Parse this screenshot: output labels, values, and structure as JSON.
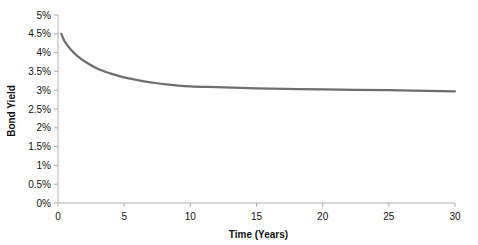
{
  "chart_data": {
    "type": "line",
    "title": "",
    "xlabel": "Time (Years)",
    "ylabel": "Bond Yield",
    "xlim": [
      0,
      30
    ],
    "ylim": [
      0,
      5
    ],
    "x_ticks": [
      0,
      5,
      10,
      15,
      20,
      25,
      30
    ],
    "x_tick_labels": [
      "0",
      "5",
      "10",
      "15",
      "20",
      "25",
      "30"
    ],
    "y_ticks": [
      0,
      0.5,
      1,
      1.5,
      2,
      2.5,
      3,
      3.5,
      4,
      4.5,
      5
    ],
    "y_tick_labels": [
      "0%",
      "0.5%",
      "1%",
      "1.5%",
      "2%",
      "2.5%",
      "3%",
      "3.5%",
      "4%",
      "4.5%",
      "5%"
    ],
    "grid": false,
    "legend": null,
    "series": [
      {
        "name": "Bond Yield",
        "color": "#6e6e6e",
        "x": [
          0.25,
          0.5,
          1,
          1.5,
          2,
          3,
          4,
          5,
          6,
          7,
          8,
          10,
          12,
          15,
          20,
          25,
          30
        ],
        "values": [
          4.5,
          4.3,
          4.07,
          3.9,
          3.77,
          3.57,
          3.44,
          3.34,
          3.27,
          3.21,
          3.16,
          3.1,
          3.08,
          3.05,
          3.02,
          3.0,
          2.97
        ]
      }
    ]
  }
}
